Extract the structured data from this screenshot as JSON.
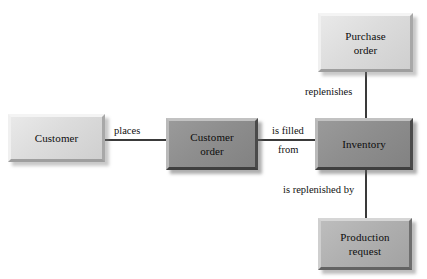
{
  "diagram": {
    "entities": [
      {
        "id": "customer",
        "name": "Customer",
        "line1": "Customer",
        "line2": "",
        "shade": "light"
      },
      {
        "id": "customer-order",
        "name": "Customer order",
        "line1": "Customer",
        "line2": "order",
        "shade": "dark"
      },
      {
        "id": "inventory",
        "name": "Inventory",
        "line1": "Inventory",
        "line2": "",
        "shade": "dark"
      },
      {
        "id": "purchase-order",
        "name": "Purchase order",
        "line1": "Purchase",
        "line2": "order",
        "shade": "light"
      },
      {
        "id": "production-request",
        "name": "Production request",
        "line1": "Production",
        "line2": "request",
        "shade": "medium"
      }
    ],
    "relationships": [
      {
        "id": "places",
        "label": "places",
        "from": "customer",
        "to": "customer-order"
      },
      {
        "id": "is-filled-from",
        "label_line1": "is filled",
        "label_line2": "from",
        "from": "customer-order",
        "to": "inventory"
      },
      {
        "id": "replenishes",
        "label": "replenishes",
        "from": "purchase-order",
        "to": "inventory"
      },
      {
        "id": "is-replenished-by",
        "label": "is replenished by",
        "from": "inventory",
        "to": "production-request"
      }
    ],
    "colors": {
      "line": "#3a3a3a",
      "light_box": "#dcdcdc",
      "medium_box": "#b0b0b0",
      "dark_box": "#8e8e8e",
      "text": "#0d0d0d",
      "background": "#ffffff"
    }
  }
}
